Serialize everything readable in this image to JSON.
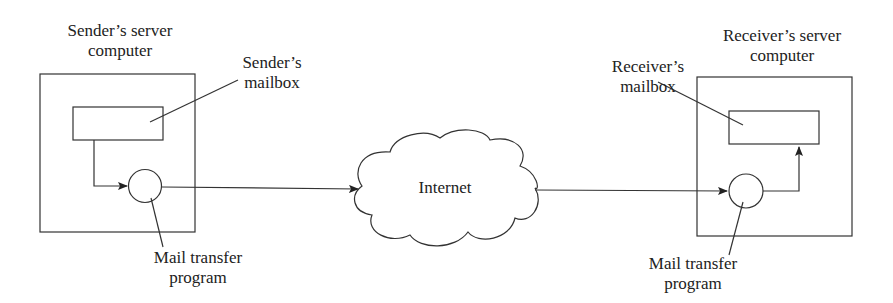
{
  "diagram": {
    "sender": {
      "server_label_line1": "Sender’s server",
      "server_label_line2": "computer",
      "mailbox_label_line1": "Sender’s",
      "mailbox_label_line2": "mailbox",
      "mta_label_line1": "Mail transfer",
      "mta_label_line2": "program"
    },
    "internet": {
      "label": "Internet"
    },
    "receiver": {
      "server_label_line1": "Receiver’s server",
      "server_label_line2": "computer",
      "mailbox_label_line1": "Receiver’s",
      "mailbox_label_line2": "mailbox",
      "mta_label_line1": "Mail transfer",
      "mta_label_line2": "program"
    },
    "colors": {
      "stroke": "#333333",
      "background": "#ffffff"
    }
  }
}
